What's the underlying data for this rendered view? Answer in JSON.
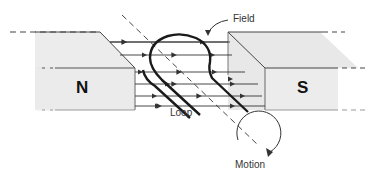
{
  "diagram": {
    "labels": {
      "field": "Field",
      "loop": "Loop",
      "motion": "Motion",
      "north_pole": "N",
      "south_pole": "S"
    },
    "colors": {
      "magnet_fill": "#ececec",
      "magnet_side": "#dedede",
      "line": "#333333",
      "loop": "#1a1a1a"
    },
    "field_lines_count": 6
  }
}
